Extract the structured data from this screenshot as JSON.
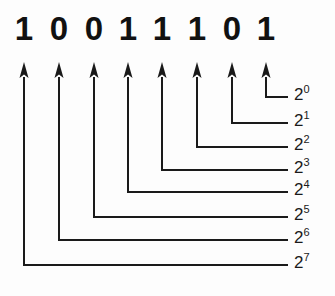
{
  "figure": {
    "type": "binary-place-value-diagram",
    "binary_value": "10011101",
    "background_color": "#fdfdfd",
    "ink_color": "#1a1a1a"
  },
  "bits": [
    {
      "index": 0,
      "digit": "1",
      "x": 24,
      "weight_label_index": 7
    },
    {
      "index": 1,
      "digit": "0",
      "x": 59,
      "weight_label_index": 6
    },
    {
      "index": 2,
      "digit": "0",
      "x": 94,
      "weight_label_index": 5
    },
    {
      "index": 3,
      "digit": "1",
      "x": 128,
      "weight_label_index": 4
    },
    {
      "index": 4,
      "digit": "1",
      "x": 162,
      "weight_label_index": 3
    },
    {
      "index": 5,
      "digit": "1",
      "x": 197,
      "weight_label_index": 2
    },
    {
      "index": 6,
      "digit": "0",
      "x": 232,
      "weight_label_index": 1
    },
    {
      "index": 7,
      "digit": "1",
      "x": 266,
      "weight_label_index": 0
    }
  ],
  "connectors": [
    {
      "from_bit_x": 266,
      "arrow_tip_y": 62,
      "corner_y": 97,
      "line_end_x": 288
    },
    {
      "from_bit_x": 232,
      "arrow_tip_y": 62,
      "corner_y": 123,
      "line_end_x": 288
    },
    {
      "from_bit_x": 197,
      "arrow_tip_y": 62,
      "corner_y": 147,
      "line_end_x": 288
    },
    {
      "from_bit_x": 162,
      "arrow_tip_y": 62,
      "corner_y": 170,
      "line_end_x": 288
    },
    {
      "from_bit_x": 128,
      "arrow_tip_y": 62,
      "corner_y": 192,
      "line_end_x": 288
    },
    {
      "from_bit_x": 94,
      "arrow_tip_y": 62,
      "corner_y": 217,
      "line_end_x": 288
    },
    {
      "from_bit_x": 59,
      "arrow_tip_y": 62,
      "corner_y": 240,
      "line_end_x": 288
    },
    {
      "from_bit_x": 24,
      "arrow_tip_y": 62,
      "corner_y": 265,
      "line_end_x": 288
    }
  ],
  "exponent_labels": [
    {
      "base": "2",
      "exponent": "0",
      "text": "2⁰",
      "value": 1,
      "y": 86
    },
    {
      "base": "2",
      "exponent": "1",
      "text": "2¹",
      "value": 2,
      "y": 112
    },
    {
      "base": "2",
      "exponent": "2",
      "text": "2²",
      "value": 4,
      "y": 136
    },
    {
      "base": "2",
      "exponent": "3",
      "text": "2³",
      "value": 8,
      "y": 159
    },
    {
      "base": "2",
      "exponent": "4",
      "text": "2⁴",
      "value": 16,
      "y": 181
    },
    {
      "base": "2",
      "exponent": "5",
      "text": "2⁵",
      "value": 32,
      "y": 206
    },
    {
      "base": "2",
      "exponent": "6",
      "text": "2⁶",
      "value": 64,
      "y": 229
    },
    {
      "base": "2",
      "exponent": "7",
      "text": "2⁷",
      "value": 128,
      "y": 254
    }
  ]
}
